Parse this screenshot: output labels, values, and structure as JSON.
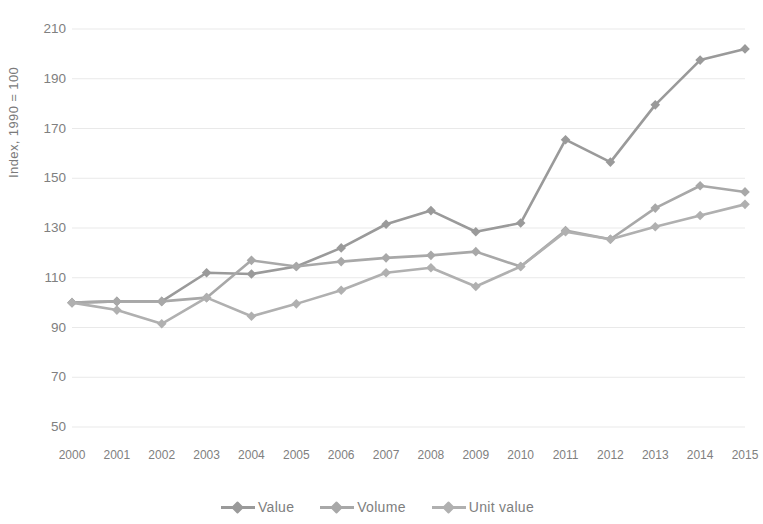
{
  "chart_data": {
    "type": "line",
    "title": "",
    "subtitle": "",
    "xlabel": "",
    "ylabel": "Index, 1990 = 100",
    "x": [
      2000,
      2001,
      2002,
      2003,
      2004,
      2005,
      2006,
      2007,
      2008,
      2009,
      2010,
      2011,
      2012,
      2013,
      2014,
      2015
    ],
    "categories": [
      "2000",
      "2001",
      "2002",
      "2003",
      "2004",
      "2005",
      "2006",
      "2007",
      "2008",
      "2009",
      "2010",
      "2011",
      "2012",
      "2013",
      "2014",
      "2015"
    ],
    "xlim": [
      2000,
      2015
    ],
    "ylim": [
      50,
      210
    ],
    "yticks": [
      50,
      70,
      90,
      110,
      130,
      150,
      170,
      190,
      210
    ],
    "ytick_labels": [
      "50",
      "70",
      "90",
      "110",
      "130",
      "150",
      "170",
      "190",
      "210"
    ],
    "grid": "horizontal",
    "legend_position": "bottom",
    "series": [
      {
        "name": "Value",
        "color": "#9a9a9a",
        "values": [
          100,
          100.5,
          100.5,
          112,
          111.5,
          114.5,
          122,
          131.5,
          137,
          128.5,
          132,
          165.5,
          156.5,
          179.5,
          197.5,
          202
        ]
      },
      {
        "name": "Volume",
        "color": "#a8a8a8",
        "values": [
          100,
          100.5,
          100.5,
          102,
          117,
          114.5,
          116.5,
          118,
          119,
          120.5,
          114.5,
          129,
          125.5,
          138,
          147,
          144.5
        ]
      },
      {
        "name": "Unit value",
        "color": "#b0b0b0",
        "values": [
          100,
          97,
          91.5,
          102,
          94.5,
          99.5,
          105,
          112,
          114,
          106.5,
          114.5,
          128.5,
          125.5,
          130.5,
          135,
          139.5
        ]
      }
    ]
  },
  "legend": {
    "items": [
      {
        "label": "Value"
      },
      {
        "label": "Volume"
      },
      {
        "label": "Unit value"
      }
    ]
  },
  "colors": {
    "line": "#a0a0a0",
    "gridline": "#e9e9e9",
    "text": "#808080"
  }
}
